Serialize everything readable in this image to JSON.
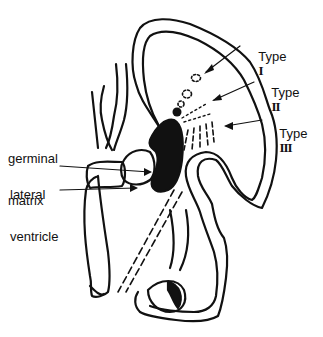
{
  "diagram": {
    "colors": {
      "ink": "#111111",
      "background": "#ffffff"
    },
    "labels": {
      "type1": {
        "word": "Type",
        "numeral": "I"
      },
      "type2": {
        "word": "Type",
        "numeral": "II"
      },
      "type3": {
        "word": "Type",
        "numeral": "III"
      },
      "germinal_matrix": {
        "line1": "germinal",
        "line2": "matrix"
      },
      "lateral_ventricle": {
        "line1": "lateral",
        "line2": "ventricle"
      }
    }
  }
}
